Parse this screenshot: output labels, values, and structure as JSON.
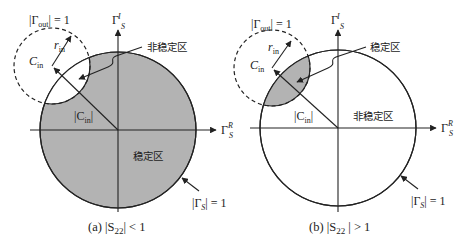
{
  "diagrams": [
    {
      "id": "a",
      "caption": "(a) |S₂₂| < 1",
      "caption_parts": {
        "prefix": "(a) |S",
        "sub": "22",
        "suffix": "| < 1"
      },
      "out_circle_label": {
        "prefix": "|Γ",
        "sub": "out",
        "suffix": "| = 1"
      },
      "imag_axis": {
        "main": "Γ",
        "sub": "S",
        "sup": "I"
      },
      "real_axis": {
        "main": "Γ",
        "sub": "S",
        "sup": "R"
      },
      "r_in": {
        "main": "r",
        "sub": "in"
      },
      "c_in": {
        "main": "C",
        "sub": "in"
      },
      "c_in_mag": {
        "prefix": "|C",
        "sub": "in",
        "suffix": "|"
      },
      "callout_region": "非稳定区",
      "inner_region": "稳定区",
      "unit_circle_label": {
        "prefix": "|Γ",
        "sub": "S",
        "suffix": "| = 1"
      },
      "unit_circle_fill": "#b3b3b3"
    },
    {
      "id": "b",
      "caption": "(b) |S₂₂| > 1",
      "caption_parts": {
        "prefix": "(b) |S",
        "sub": "22",
        "suffix": " | > 1"
      },
      "out_circle_label": {
        "prefix": "|Γ",
        "sub": "out",
        "suffix": "| = 1"
      },
      "imag_axis": {
        "main": "Γ",
        "sub": "S",
        "sup": "I"
      },
      "real_axis": {
        "main": "Γ",
        "sub": "S",
        "sup": "R"
      },
      "r_in": {
        "main": "r",
        "sub": "in"
      },
      "c_in": {
        "main": "C",
        "sub": "in"
      },
      "c_in_mag": {
        "prefix": "|C",
        "sub": "in",
        "suffix": "|"
      },
      "callout_region": "稳定区",
      "inner_region": "非稳定区",
      "unit_circle_label": {
        "prefix": "|Γ",
        "sub": "S",
        "suffix": "| = 1"
      },
      "lens_fill": "#b3b3b3"
    }
  ]
}
